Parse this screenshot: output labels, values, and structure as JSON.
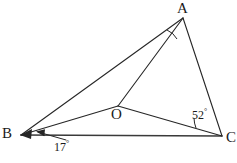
{
  "figure": {
    "kind": "geometry-diagram",
    "stroke_color": "#262626",
    "background_color": "#ffffff",
    "label_color": "#1a1a1a"
  },
  "vertices": {
    "A": {
      "label": "A",
      "x": 183,
      "y": 18
    },
    "B": {
      "label": "B",
      "x": 21,
      "y": 135
    },
    "C": {
      "label": "C",
      "x": 222,
      "y": 136
    },
    "O": {
      "label": "O",
      "x": 118,
      "y": 106
    }
  },
  "segments": [
    {
      "name": "segment-BA",
      "from": "B",
      "to": "A"
    },
    {
      "name": "segment-AC",
      "from": "A",
      "to": "C"
    },
    {
      "name": "segment-BC",
      "from": "B",
      "to": "C"
    },
    {
      "name": "segment-BO",
      "from": "B",
      "to": "O"
    },
    {
      "name": "segment-AO",
      "from": "A",
      "to": "O"
    },
    {
      "name": "segment-OC",
      "from": "O",
      "to": "C"
    }
  ],
  "angles": [
    {
      "name": "angle-at-A",
      "vertex": "A",
      "between": [
        "AB",
        "AO"
      ],
      "marked": true,
      "value": "",
      "degree_symbol": ""
    },
    {
      "name": "angle-at-B",
      "vertex": "B",
      "between": [
        "BO",
        "BC"
      ],
      "marked": true,
      "value": "17",
      "degree_symbol": "°",
      "leader_arrow": true
    },
    {
      "name": "angle-at-C",
      "vertex": "C",
      "between": [
        "CO",
        "CB"
      ],
      "marked": true,
      "value": "52",
      "degree_symbol": "°",
      "leader_arrow": false
    }
  ]
}
